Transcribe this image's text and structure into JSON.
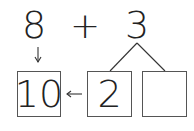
{
  "equation": {
    "left_operand": "8",
    "operator": "+",
    "right_operand": "3"
  },
  "decomposition": {
    "parts": [
      "2",
      ""
    ]
  },
  "result_box": "10",
  "colors": {
    "ink": "#222222",
    "box_border": "#555555",
    "background": "#ffffff"
  }
}
